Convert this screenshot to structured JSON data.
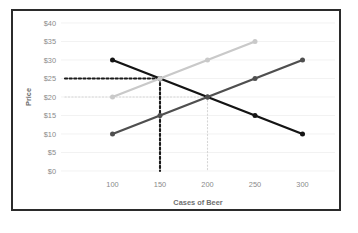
{
  "chart_data": {
    "type": "line",
    "title": "",
    "xlabel": "Cases of Beer",
    "ylabel": "Price",
    "xlim": [
      50,
      330
    ],
    "ylim": [
      0,
      40
    ],
    "xticks": [
      100,
      150,
      200,
      250,
      300
    ],
    "xtick_labels": [
      "100",
      "150",
      "200",
      "250",
      "300"
    ],
    "yticks": [
      0,
      5,
      10,
      15,
      20,
      25,
      30,
      35,
      40
    ],
    "ytick_labels": [
      "$0",
      "$5",
      "$10",
      "$15",
      "$20",
      "$25",
      "$30",
      "$35",
      "$40"
    ],
    "grid": "horizontal",
    "legend": "none",
    "series": [
      {
        "name": "demand",
        "color": "#141414",
        "x": [
          100,
          150,
          200,
          250,
          300
        ],
        "y": [
          30,
          25,
          20,
          15,
          10
        ],
        "markers": [
          true,
          true,
          true,
          true,
          true
        ]
      },
      {
        "name": "supply-original",
        "color": "#4f4f4f",
        "x": [
          100,
          150,
          200,
          250,
          300
        ],
        "y": [
          10,
          15,
          20,
          25,
          30
        ],
        "markers": [
          true,
          true,
          true,
          true,
          true
        ]
      },
      {
        "name": "supply-shifted",
        "color": "#c9c9c9",
        "x": [
          100,
          150,
          200,
          250
        ],
        "y": [
          20,
          25,
          30,
          35
        ],
        "markers": [
          true,
          true,
          true,
          true
        ]
      }
    ],
    "annotations": [
      {
        "name": "equilibrium-original",
        "x": 200,
        "y": 20,
        "style": "dotted",
        "color": "#d6d6d6",
        "label": ""
      },
      {
        "name": "equilibrium-new",
        "x": 150,
        "y": 25,
        "style": "dotted",
        "color": "#1a1a1a",
        "label": ""
      }
    ]
  },
  "axis": {
    "x_title": "Cases of Beer",
    "y_title": "Price"
  }
}
